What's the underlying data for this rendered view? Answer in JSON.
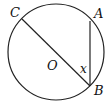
{
  "diagram": {
    "type": "circle-geometry",
    "circle": {
      "center_label": "O",
      "cx": 56,
      "cy": 52,
      "r": 48
    },
    "points": [
      {
        "label": "C",
        "x": 22,
        "y": 19
      },
      {
        "label": "A",
        "x": 90,
        "y": 21
      },
      {
        "label": "B",
        "x": 90,
        "y": 86
      }
    ],
    "segments": [
      [
        "C",
        "B"
      ],
      [
        "A",
        "B"
      ]
    ],
    "angle_label": "x",
    "labels": {
      "C": "C",
      "A": "A",
      "O": "O",
      "x": "x",
      "B": "B"
    },
    "stroke_color": "#222222"
  }
}
